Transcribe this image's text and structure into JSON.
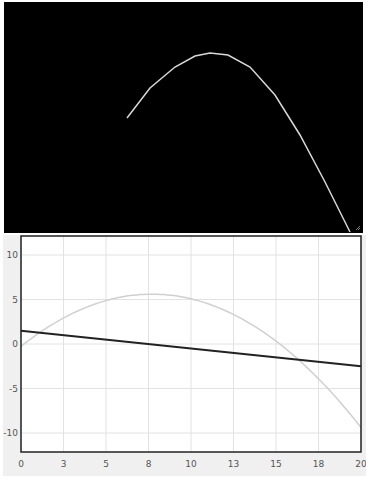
{
  "top_panel": {
    "background": "#000000",
    "curve_color": "#d8d8d8",
    "curve_points": [
      [
        127,
        118
      ],
      [
        150,
        88
      ],
      [
        175,
        67
      ],
      [
        195,
        56
      ],
      [
        210,
        53
      ],
      [
        228,
        55
      ],
      [
        250,
        67
      ],
      [
        275,
        95
      ],
      [
        300,
        135
      ],
      [
        325,
        182
      ],
      [
        350,
        232
      ]
    ]
  },
  "chart_data": {
    "type": "line",
    "title": "",
    "xlabel": "",
    "ylabel": "",
    "xlim": [
      0,
      20
    ],
    "ylim": [
      -12,
      12
    ],
    "grid": true,
    "x_ticks": [
      "0",
      "3",
      "5",
      "8",
      "10",
      "13",
      "15",
      "18",
      "20"
    ],
    "y_ticks": [
      "10",
      "5",
      "0",
      "-5",
      "-10"
    ],
    "series": [
      {
        "name": "parabola",
        "color": "#d0d0d0",
        "x": [
          0,
          2,
          4,
          6,
          7.7,
          10,
          12,
          14,
          16,
          18,
          20
        ],
        "values": [
          0.3,
          2.9,
          4.5,
          5.3,
          5.6,
          5.1,
          3.8,
          1.7,
          -1.2,
          -5.0,
          -10.0
        ]
      },
      {
        "name": "line",
        "color": "#222222",
        "x": [
          0,
          20
        ],
        "values": [
          1.5,
          -2.5
        ]
      }
    ]
  }
}
